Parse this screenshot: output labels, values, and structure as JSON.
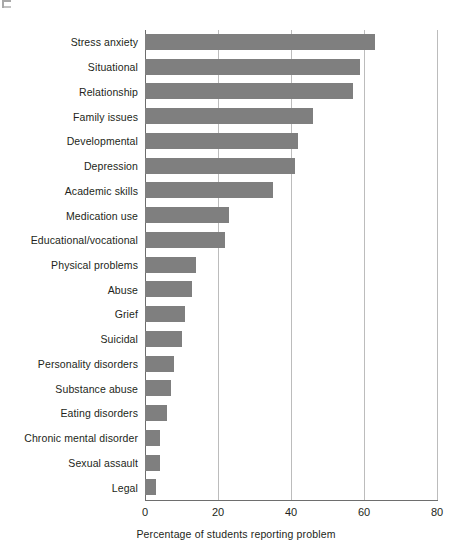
{
  "figure": {
    "corner_mark": "page-crop-artifact"
  },
  "chart_data": {
    "type": "bar",
    "orientation": "horizontal",
    "title": "",
    "xlabel": "Percentage of students reporting problem",
    "ylabel": "",
    "xlim": [
      0,
      80
    ],
    "xticks": [
      0,
      20,
      40,
      60,
      80
    ],
    "xtick_labels": [
      "0",
      "20",
      "40",
      "60",
      "80"
    ],
    "grid": "vertical",
    "legend": "none",
    "bar_color": "#7f7f7f",
    "gridline_color": "#bcbcbc",
    "axis_color": "#6e6e6e",
    "categories": [
      "Stress anxiety",
      "Situational",
      "Relationship",
      "Family issues",
      "Developmental",
      "Depression",
      "Academic skills",
      "Medication use",
      "Educational/vocational",
      "Physical problems",
      "Abuse",
      "Grief",
      "Suicidal",
      "Personality disorders",
      "Substance abuse",
      "Eating disorders",
      "Chronic mental disorder",
      "Sexual assault",
      "Legal"
    ],
    "values": [
      63,
      59,
      57,
      46,
      42,
      41,
      35,
      23,
      22,
      14,
      13,
      11,
      10,
      8,
      7,
      6,
      4,
      4,
      3
    ]
  }
}
